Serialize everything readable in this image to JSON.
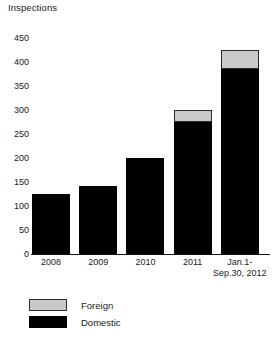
{
  "chart_data": {
    "type": "bar",
    "title": "Inspections",
    "subtitle": "",
    "xlabel": "",
    "ylabel": "Inspections",
    "ylim": [
      0,
      450
    ],
    "ytick_step": 50,
    "yticks": [
      450,
      400,
      350,
      300,
      250,
      200,
      150,
      100,
      50,
      0
    ],
    "grid": false,
    "stacked": true,
    "legend_position": "bottom-left",
    "categories": [
      "2008",
      "2009",
      "2010",
      "2011",
      "Jan.1-Sep.30, 2012"
    ],
    "category_lines": [
      [
        "2008"
      ],
      [
        "2009"
      ],
      [
        "2010"
      ],
      [
        "2011"
      ],
      [
        "Jan.1-",
        "Sep.30, 2012"
      ]
    ],
    "series": [
      {
        "name": "Domestic",
        "color": "#000000",
        "values": [
          125,
          142,
          200,
          275,
          385
        ]
      },
      {
        "name": "Foreign",
        "color": "#c9c9c9",
        "values": [
          0,
          0,
          0,
          25,
          40
        ]
      }
    ],
    "totals": [
      125,
      142,
      200,
      300,
      425
    ]
  },
  "legend": {
    "items": [
      {
        "label": "Foreign",
        "swatch": "#c9c9c9"
      },
      {
        "label": "Domestic",
        "swatch": "#000000"
      }
    ]
  },
  "footnote": {
    "text": ""
  }
}
